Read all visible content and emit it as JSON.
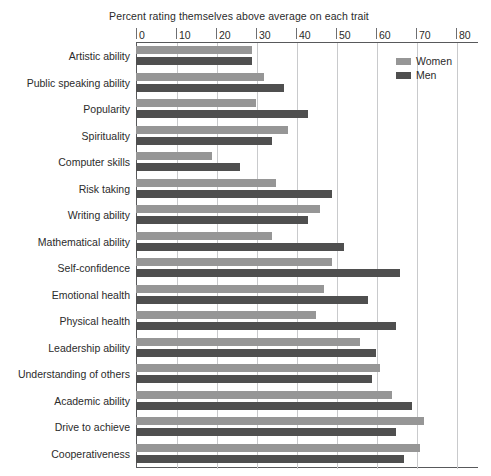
{
  "chart_data": {
    "type": "bar",
    "orientation": "horizontal",
    "title": "Percent rating themselves above average on each trait",
    "xlabel": "",
    "ylabel": "",
    "xlim": [
      0,
      80
    ],
    "xticks": [
      0,
      10,
      20,
      30,
      40,
      50,
      60,
      70,
      80
    ],
    "grid": true,
    "legend_position": "top-right",
    "categories": [
      "Artistic ability",
      "Public speaking ability",
      "Popularity",
      "Spirituality",
      "Computer skills",
      "Risk taking",
      "Writing ability",
      "Mathematical ability",
      "Self-confidence",
      "Emotional health",
      "Physical health",
      "Leadership ability",
      "Understanding of others",
      "Academic ability",
      "Drive to achieve",
      "Cooperativeness"
    ],
    "series": [
      {
        "name": "Women",
        "color": "#969696",
        "values": [
          29,
          32,
          30,
          38,
          19,
          35,
          46,
          34,
          49,
          47,
          45,
          56,
          61,
          64,
          72,
          71
        ]
      },
      {
        "name": "Men",
        "color": "#4f4f4f",
        "values": [
          29,
          37,
          43,
          34,
          26,
          49,
          43,
          52,
          66,
          58,
          65,
          60,
          59,
          69,
          65,
          67
        ]
      }
    ]
  },
  "legend": {
    "entries": [
      {
        "label": "Women",
        "swatch": "women-swatch"
      },
      {
        "label": "Men",
        "swatch": "men-swatch"
      }
    ]
  }
}
